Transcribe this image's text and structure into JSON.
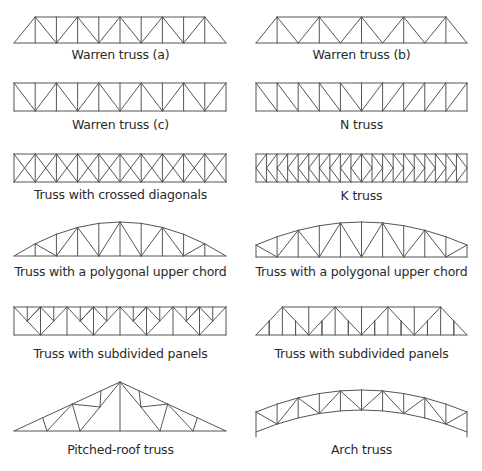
{
  "figure": {
    "stroke_color": "#555555",
    "background": "#ffffff",
    "diagrams": [
      {
        "id": "warren-a",
        "label": "Warren truss (a)",
        "column": "left",
        "label_y": 54
      },
      {
        "id": "warren-b",
        "label": "Warren truss (b)",
        "column": "right",
        "label_y": 54
      },
      {
        "id": "warren-c",
        "label": "Warren truss (c)",
        "column": "left",
        "label_y": 118
      },
      {
        "id": "n-truss",
        "label": "N truss",
        "column": "right",
        "label_y": 118
      },
      {
        "id": "crossed",
        "label": "Truss with crossed diagonals",
        "column": "left",
        "label_y": 190
      },
      {
        "id": "k-truss",
        "label": "K truss",
        "column": "right",
        "label_y": 190
      },
      {
        "id": "polygonal-a",
        "label": "Truss with a polygonal upper chord",
        "column": "left",
        "label_y": 264
      },
      {
        "id": "polygonal-b",
        "label": "Truss with a polygonal upper chord",
        "column": "right",
        "label_y": 264
      },
      {
        "id": "subdivided-a",
        "label": "Truss with subdivided panels",
        "column": "left",
        "label_y": 345
      },
      {
        "id": "subdivided-b",
        "label": "Truss with subdivided panels",
        "column": "right",
        "label_y": 345
      },
      {
        "id": "pitched-roof",
        "label": "Pitched-roof truss",
        "column": "left",
        "label_y": 444
      },
      {
        "id": "arch",
        "label": "Arch truss",
        "column": "right",
        "label_y": 444
      }
    ]
  }
}
